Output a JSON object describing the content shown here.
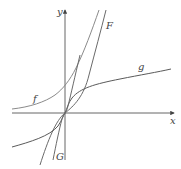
{
  "diagram": {
    "title": "",
    "axes": {
      "x_label": "x",
      "y_label": "y"
    },
    "curves": [
      {
        "name": "f",
        "label": "f",
        "color": "#7a7a7a",
        "description": "increasing convex curve, left asymptote near x-axis"
      },
      {
        "name": "F",
        "label": "F",
        "color": "#6a6a6a",
        "description": "steep cubic-like curve through origin"
      },
      {
        "name": "g",
        "label": "g",
        "color": "#5a5a5a",
        "description": "arctan-like increasing curve through origin"
      },
      {
        "name": "G",
        "label": "G",
        "color": "#6a6a6a",
        "description": "steep curve through origin, flat near origin"
      }
    ],
    "colors": {
      "axis": "#555555",
      "background": "#ffffff"
    }
  }
}
